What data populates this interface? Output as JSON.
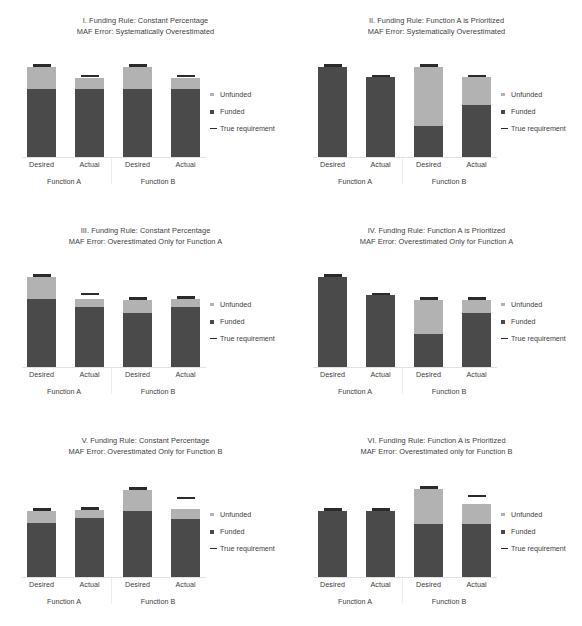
{
  "figure": {
    "width": 582,
    "height": 626,
    "background": "#ffffff",
    "colors": {
      "unfunded": "#b2b2b2",
      "funded": "#4a4a4a",
      "true_requirement": "#2b2b2b",
      "text": "#404040",
      "axis_line": "#e2e2e2"
    }
  },
  "legend": {
    "items": [
      {
        "label": "Unfunded",
        "marker": "small-square-light",
        "color": "#b2b2b2"
      },
      {
        "label": "Funded",
        "marker": "small-square-dark",
        "color": "#4a4a4a"
      },
      {
        "label": "True requirement",
        "marker": "dash",
        "color": "#2b2b2b"
      }
    ]
  },
  "axis": {
    "category_labels": [
      "Desired",
      "Actual",
      "Desired",
      "Actual"
    ],
    "group_labels": [
      "Function A",
      "Function B"
    ]
  },
  "chart_data": [
    {
      "id": "I",
      "type": "bar",
      "stacked": true,
      "title_line1": "I. Funding Rule: Constant Percentage",
      "title_line2": "MAF Error: Systematically Overestimated",
      "xlabel": "",
      "ylabel": "",
      "ylim": [
        0,
        100
      ],
      "grid": false,
      "legend_position": "right",
      "categories": [
        "Desired",
        "Actual",
        "Desired",
        "Actual"
      ],
      "groups": [
        "Function A",
        "Function A",
        "Function B",
        "Function B"
      ],
      "series": [
        {
          "name": "Funded",
          "values": [
            72,
            72,
            72,
            72
          ]
        },
        {
          "name": "Unfunded",
          "values": [
            23,
            11,
            23,
            11
          ]
        }
      ],
      "true_requirement": [
        95,
        84,
        95,
        84
      ]
    },
    {
      "id": "II",
      "type": "bar",
      "stacked": true,
      "title_line1": "II. Funding Rule: Function A is Prioritized",
      "title_line2": "MAF Error: Systematically Overestimated",
      "xlabel": "",
      "ylabel": "",
      "ylim": [
        0,
        100
      ],
      "grid": false,
      "legend_position": "right",
      "categories": [
        "Desired",
        "Actual",
        "Desired",
        "Actual"
      ],
      "groups": [
        "Function A",
        "Function A",
        "Function B",
        "Function B"
      ],
      "series": [
        {
          "name": "Funded",
          "values": [
            95,
            84,
            33,
            55
          ]
        },
        {
          "name": "Unfunded",
          "values": [
            0,
            0,
            62,
            29
          ]
        }
      ],
      "true_requirement": [
        95,
        84,
        95,
        84
      ]
    },
    {
      "id": "III",
      "type": "bar",
      "stacked": true,
      "title_line1": "III. Funding Rule: Constant Percentage",
      "title_line2": "MAF Error: Overestimated Only for Function A",
      "xlabel": "",
      "ylabel": "",
      "ylim": [
        0,
        100
      ],
      "grid": false,
      "legend_position": "right",
      "categories": [
        "Desired",
        "Actual",
        "Desired",
        "Actual"
      ],
      "groups": [
        "Function A",
        "Function A",
        "Function B",
        "Function B"
      ],
      "series": [
        {
          "name": "Funded",
          "values": [
            72,
            64,
            57,
            64
          ]
        },
        {
          "name": "Unfunded",
          "values": [
            23,
            8,
            14,
            8
          ]
        }
      ],
      "true_requirement": [
        95,
        76,
        71,
        72
      ]
    },
    {
      "id": "IV",
      "type": "bar",
      "stacked": true,
      "title_line1": "IV. Funding Rule: Function A is Prioritized",
      "title_line2": "MAF Error: Overestimated Only for Function A",
      "xlabel": "",
      "ylabel": "",
      "ylim": [
        0,
        100
      ],
      "grid": false,
      "legend_position": "right",
      "categories": [
        "Desired",
        "Actual",
        "Desired",
        "Actual"
      ],
      "groups": [
        "Function A",
        "Function A",
        "Function B",
        "Function B"
      ],
      "series": [
        {
          "name": "Funded",
          "values": [
            95,
            76,
            35,
            57
          ]
        },
        {
          "name": "Unfunded",
          "values": [
            0,
            0,
            36,
            14
          ]
        }
      ],
      "true_requirement": [
        95,
        76,
        71,
        71
      ]
    },
    {
      "id": "V",
      "type": "bar",
      "stacked": true,
      "title_line1": "V. Funding Rule: Constant Percentage",
      "title_line2": "MAF Error: Overestimated Only for Function B",
      "xlabel": "",
      "ylabel": "",
      "ylim": [
        0,
        100
      ],
      "grid": false,
      "legend_position": "right",
      "categories": [
        "Desired",
        "Actual",
        "Desired",
        "Actual"
      ],
      "groups": [
        "Function A",
        "Function A",
        "Function B",
        "Function B"
      ],
      "series": [
        {
          "name": "Funded",
          "values": [
            57,
            62,
            70,
            61
          ]
        },
        {
          "name": "Unfunded",
          "values": [
            13,
            9,
            22,
            11
          ]
        }
      ],
      "true_requirement": [
        70,
        71,
        92,
        82
      ]
    },
    {
      "id": "VI",
      "type": "bar",
      "stacked": true,
      "title_line1": "VI. Funding Rule: Function A is Prioritized",
      "title_line2": "MAF Error: Overestimated only for Function B",
      "xlabel": "",
      "ylabel": "",
      "ylim": [
        0,
        100
      ],
      "grid": false,
      "legend_position": "right",
      "categories": [
        "Desired",
        "Actual",
        "Desired",
        "Actual"
      ],
      "groups": [
        "Function A",
        "Function A",
        "Function B",
        "Function B"
      ],
      "series": [
        {
          "name": "Funded",
          "values": [
            70,
            70,
            56,
            56
          ]
        },
        {
          "name": "Unfunded",
          "values": [
            0,
            0,
            37,
            21
          ]
        }
      ],
      "true_requirement": [
        70,
        70,
        93,
        84
      ]
    }
  ]
}
